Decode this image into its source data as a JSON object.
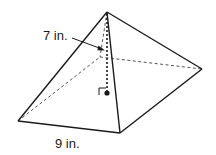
{
  "figure": {
    "type": "square pyramid",
    "labels": {
      "height": "7 in.",
      "base_edge": "9 in."
    },
    "colors": {
      "stroke": "#1a1a1a",
      "background": "#ffffff"
    }
  }
}
